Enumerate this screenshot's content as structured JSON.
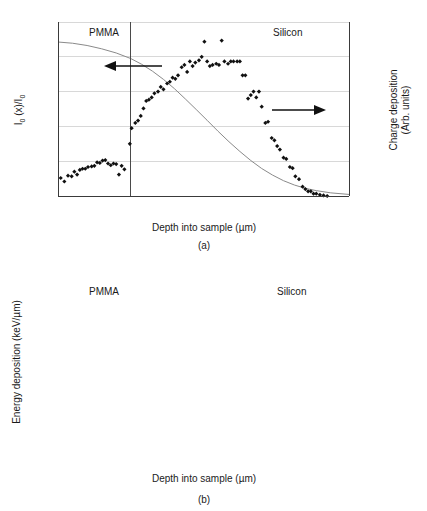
{
  "figure": {
    "panels": [
      {
        "id": "a",
        "caption": "(a)"
      },
      {
        "id": "b",
        "caption": "(b)"
      }
    ]
  },
  "chart_data": [
    {
      "type": "scatter",
      "panel": "a",
      "title": "",
      "xlabel": "Depth into sample (µm)",
      "ylabel": "I₀ (x)/I₀",
      "y2label": "Charge deposition (Arb. units)",
      "xlim": [
        0,
        1.6
      ],
      "ylim": [
        0,
        1
      ],
      "y2lim": [
        0,
        1.5
      ],
      "xticks": [
        "0",
        "0.4",
        "0.8",
        "1.2",
        "1.6"
      ],
      "xtickvals": [
        0,
        0.4,
        0.8,
        1.2,
        1.6
      ],
      "yticks": [
        "0",
        "0.2",
        "0.4",
        "0.6",
        "0.8",
        "1"
      ],
      "ytickvals": [
        0,
        0.2,
        0.4,
        0.6,
        0.8,
        1.0
      ],
      "y2ticks": [
        "0",
        "0.5",
        "1",
        "1.5"
      ],
      "y2tickvals": [
        0,
        0.5,
        1.0,
        1.5
      ],
      "grid": true,
      "legend": "none",
      "annotations": [
        {
          "text": "PMMA",
          "x": 0.17,
          "y": 0.93
        },
        {
          "text": "Silicon",
          "x": 1.18,
          "y": 0.93
        },
        {
          "text": "left-arrow",
          "x": 0.31,
          "y": 0.755
        },
        {
          "text": "right-arrow",
          "x": 1.07,
          "y": 0.475
        }
      ],
      "boundary_x": 0.4,
      "series": [
        {
          "name": "Charge deposition",
          "axis": "right",
          "marker": "diamond",
          "x": [
            0.015,
            0.035,
            0.055,
            0.075,
            0.09,
            0.105,
            0.12,
            0.135,
            0.15,
            0.165,
            0.185,
            0.2,
            0.215,
            0.23,
            0.245,
            0.26,
            0.275,
            0.29,
            0.305,
            0.32,
            0.335,
            0.35,
            0.365,
            0.395,
            0.405,
            0.425,
            0.44,
            0.455,
            0.47,
            0.485,
            0.5,
            0.515,
            0.53,
            0.55,
            0.565,
            0.58,
            0.6,
            0.615,
            0.63,
            0.645,
            0.66,
            0.68,
            0.695,
            0.71,
            0.725,
            0.74,
            0.755,
            0.775,
            0.79,
            0.805,
            0.82,
            0.835,
            0.85,
            0.87,
            0.885,
            0.9,
            0.915,
            0.935,
            0.95,
            0.965,
            0.985,
            1.0,
            1.015,
            1.03,
            1.045,
            1.06,
            1.075,
            1.09,
            1.105,
            1.12,
            1.14,
            1.155,
            1.175,
            1.19,
            1.205,
            1.22,
            1.24,
            1.255,
            1.275,
            1.29,
            1.305,
            1.325,
            1.345,
            1.36,
            1.375,
            1.39,
            1.405,
            1.42,
            1.44,
            1.46,
            1.48
          ],
          "y": [
            0.155,
            0.125,
            0.175,
            0.17,
            0.21,
            0.185,
            0.225,
            0.235,
            0.235,
            0.25,
            0.255,
            0.26,
            0.29,
            0.285,
            0.305,
            0.31,
            0.28,
            0.265,
            0.28,
            0.275,
            0.185,
            0.26,
            0.23,
            0.45,
            0.585,
            0.63,
            0.65,
            0.69,
            0.755,
            0.82,
            0.83,
            0.85,
            0.885,
            0.9,
            0.94,
            0.92,
            0.97,
            0.985,
            1.02,
            1.01,
            1.04,
            1.11,
            1.13,
            1.07,
            1.16,
            1.12,
            1.15,
            1.17,
            1.2,
            1.33,
            1.16,
            1.12,
            1.13,
            1.14,
            1.13,
            1.34,
            1.16,
            1.14,
            1.16,
            1.16,
            1.16,
            1.16,
            1.04,
            1.04,
            0.84,
            0.87,
            0.9,
            0.85,
            0.9,
            0.77,
            0.63,
            0.64,
            0.5,
            0.48,
            0.43,
            0.4,
            0.33,
            0.32,
            0.25,
            0.24,
            0.17,
            0.145,
            0.08,
            0.06,
            0.04,
            0.04,
            0.02,
            0.02,
            0.01,
            0.005,
            0.0
          ]
        },
        {
          "name": "Transmitted intensity ratio",
          "axis": "left",
          "marker": "line",
          "x": [
            0.0,
            0.08,
            0.16,
            0.24,
            0.32,
            0.4,
            0.46,
            0.52,
            0.58,
            0.64,
            0.7,
            0.76,
            0.82,
            0.88,
            0.94,
            1.0,
            1.06,
            1.12,
            1.18,
            1.24,
            1.3,
            1.36,
            1.42,
            1.5,
            1.6
          ],
          "y": [
            0.885,
            0.878,
            0.865,
            0.846,
            0.822,
            0.79,
            0.757,
            0.717,
            0.67,
            0.617,
            0.558,
            0.497,
            0.435,
            0.372,
            0.312,
            0.256,
            0.204,
            0.158,
            0.12,
            0.088,
            0.063,
            0.044,
            0.031,
            0.018,
            0.009
          ]
        }
      ]
    },
    {
      "type": "scatter",
      "panel": "b",
      "title": "",
      "xlabel": "Depth into sample (µm)",
      "ylabel": "Energy deposition (keV/µm)",
      "xlim": [
        0,
        1.6
      ],
      "ylim": [
        0,
        14
      ],
      "xticks": [
        "0",
        "0.4",
        "0.8",
        "1.2",
        "1.6"
      ],
      "xtickvals": [
        0,
        0.4,
        0.8,
        1.2,
        1.6
      ],
      "yticks": [
        "0",
        "2",
        "4",
        "6",
        "8",
        "10",
        "12",
        "14"
      ],
      "ytickvals": [
        0,
        2,
        4,
        6,
        8,
        10,
        12,
        14
      ],
      "grid": true,
      "legend": "none",
      "annotations": [
        {
          "text": "PMMA",
          "x": 0.17,
          "y": 12.9
        },
        {
          "text": "Silicon",
          "x": 1.2,
          "y": 12.9
        }
      ],
      "boundary_x": 0.4,
      "series": [
        {
          "name": "Energy deposition",
          "axis": "left",
          "marker": "diamond",
          "x": [
            0.015,
            0.03,
            0.045,
            0.06,
            0.075,
            0.09,
            0.105,
            0.12,
            0.135,
            0.15,
            0.165,
            0.18,
            0.195,
            0.21,
            0.225,
            0.24,
            0.255,
            0.27,
            0.285,
            0.3,
            0.315,
            0.33,
            0.345,
            0.36,
            0.375,
            0.39,
            0.405,
            0.425,
            0.445,
            0.465,
            0.485,
            0.5,
            0.515,
            0.53,
            0.545,
            0.56,
            0.575,
            0.59,
            0.605,
            0.62,
            0.635,
            0.65,
            0.665,
            0.68,
            0.695,
            0.71,
            0.725,
            0.74,
            0.755,
            0.77,
            0.785,
            0.8,
            0.82,
            0.835,
            0.85,
            0.87,
            0.885,
            0.9,
            0.92,
            0.935,
            0.955,
            0.975,
            0.995,
            1.015,
            1.035,
            1.055,
            1.075,
            1.095,
            1.115,
            1.135,
            1.155,
            1.175,
            1.195,
            1.215,
            1.235,
            1.255,
            1.275,
            1.3,
            1.32,
            1.34,
            1.36,
            1.38,
            1.4,
            1.42,
            1.44,
            1.46,
            1.48,
            1.5
          ],
          "y": [
            3.55,
            3.7,
            3.78,
            3.82,
            3.88,
            3.9,
            3.95,
            3.98,
            4.0,
            4.05,
            4.22,
            4.3,
            4.35,
            4.42,
            4.48,
            4.55,
            4.62,
            4.72,
            4.78,
            4.85,
            4.88,
            4.9,
            4.9,
            4.92,
            5.1,
            5.7,
            6.45,
            8.55,
            9.9,
            10.9,
            11.5,
            11.7,
            11.9,
            12.1,
            12.25,
            12.5,
            12.6,
            12.75,
            12.95,
            13.05,
            13.0,
            12.95,
            12.8,
            12.55,
            12.5,
            12.2,
            12.0,
            11.85,
            11.6,
            11.45,
            11.3,
            11.15,
            10.9,
            10.6,
            10.4,
            9.85,
            9.6,
            9.35,
            9.0,
            8.7,
            8.35,
            7.9,
            7.45,
            7.05,
            6.6,
            6.15,
            5.6,
            5.1,
            4.6,
            4.1,
            3.55,
            3.1,
            2.6,
            2.25,
            1.85,
            1.45,
            1.35,
            0.95,
            0.75,
            0.55,
            0.4,
            0.25,
            0.18,
            0.13,
            0.1,
            0.08,
            0.07,
            0.06
          ]
        }
      ]
    }
  ]
}
